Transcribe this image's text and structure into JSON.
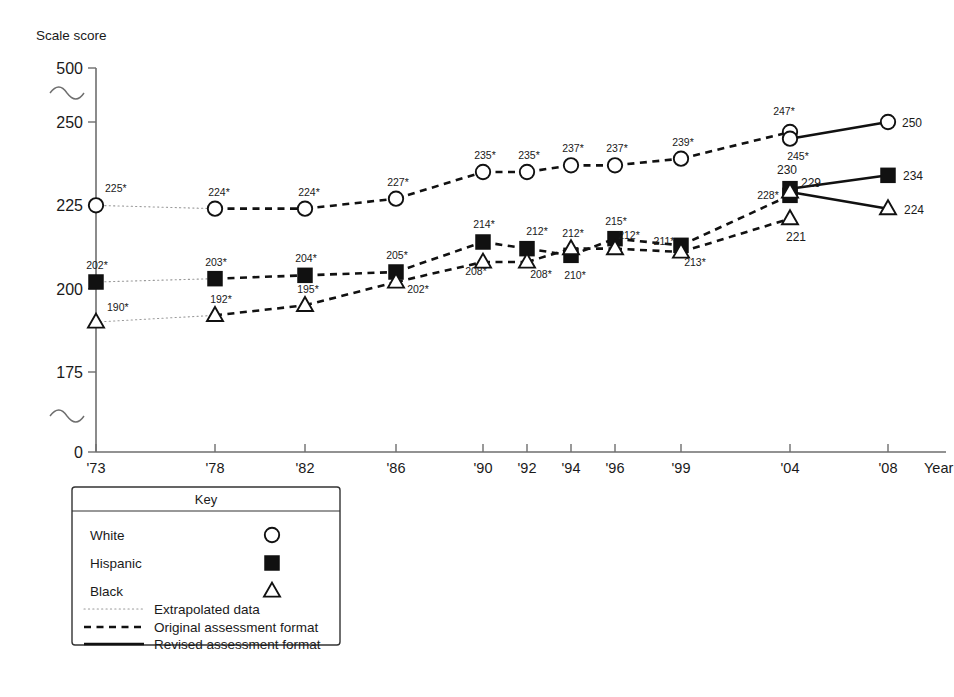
{
  "axes": {
    "y_title": "Scale score",
    "x_title": "Year",
    "y_ticks": [
      "500",
      "250",
      "225",
      "200",
      "175",
      "0"
    ],
    "x_ticks": [
      "'73",
      "'78",
      "'82",
      "'86",
      "'90",
      "'92",
      "'94",
      "'96",
      "'99",
      "'04",
      "'08"
    ]
  },
  "key": {
    "title": "Key",
    "series": [
      {
        "label": "White",
        "marker": "circle-open-icon"
      },
      {
        "label": "Hispanic",
        "marker": "square-filled-icon"
      },
      {
        "label": "Black",
        "marker": "triangle-open-icon"
      }
    ],
    "lines": [
      {
        "label": "Extrapolated data",
        "style": "dotted-line-icon"
      },
      {
        "label": "Original assessment format",
        "style": "dashed-line-icon"
      },
      {
        "label": "Revised assessment format",
        "style": "solid-line-icon"
      }
    ]
  },
  "chart_data": {
    "type": "line",
    "title": "",
    "xlabel": "Year",
    "ylabel": "Scale score",
    "x": [
      "'73",
      "'78",
      "'82",
      "'86",
      "'90",
      "'92",
      "'94",
      "'96",
      "'99",
      "'04",
      "'08"
    ],
    "ylim": [
      175,
      250
    ],
    "y_axis_breaks": [
      "between 0 and 175",
      "between 250 and 500"
    ],
    "y_ticks": [
      0,
      175,
      200,
      225,
      250,
      500
    ],
    "grid": false,
    "legend_position": "below-left",
    "note": "Asterisk (*) marks values significantly different from 2008. At '04 both original and revised assessment formats were administered, giving two points per series.",
    "series": [
      {
        "name": "White",
        "marker": "circle-open",
        "points": [
          {
            "x": "'73",
            "value": 225,
            "label": "225*",
            "significant": true,
            "segment": "extrapolated"
          },
          {
            "x": "'78",
            "value": 224,
            "label": "224*",
            "significant": true,
            "segment": "original"
          },
          {
            "x": "'82",
            "value": 224,
            "label": "224*",
            "significant": true,
            "segment": "original"
          },
          {
            "x": "'86",
            "value": 227,
            "label": "227*",
            "significant": true,
            "segment": "original"
          },
          {
            "x": "'90",
            "value": 235,
            "label": "235*",
            "significant": true,
            "segment": "original"
          },
          {
            "x": "'92",
            "value": 235,
            "label": "235*",
            "significant": true,
            "segment": "original"
          },
          {
            "x": "'94",
            "value": 237,
            "label": "237*",
            "significant": true,
            "segment": "original"
          },
          {
            "x": "'96",
            "value": 237,
            "label": "237*",
            "significant": true,
            "segment": "original"
          },
          {
            "x": "'99",
            "value": 239,
            "label": "239*",
            "significant": true,
            "segment": "original"
          },
          {
            "x": "'04",
            "value": 247,
            "label": "247*",
            "significant": true,
            "segment": "original"
          },
          {
            "x": "'04",
            "value": 245,
            "label": "245*",
            "significant": true,
            "segment": "revised"
          },
          {
            "x": "'08",
            "value": 250,
            "label": "250",
            "significant": false,
            "segment": "revised"
          }
        ]
      },
      {
        "name": "Hispanic",
        "marker": "square-filled",
        "points": [
          {
            "x": "'73",
            "value": 202,
            "label": "202*",
            "significant": true,
            "segment": "extrapolated"
          },
          {
            "x": "'78",
            "value": 203,
            "label": "203*",
            "significant": true,
            "segment": "original"
          },
          {
            "x": "'82",
            "value": 204,
            "label": "204*",
            "significant": true,
            "segment": "original"
          },
          {
            "x": "'86",
            "value": 205,
            "label": "205*",
            "significant": true,
            "segment": "original"
          },
          {
            "x": "'90",
            "value": 214,
            "label": "214*",
            "significant": true,
            "segment": "original"
          },
          {
            "x": "'92",
            "value": 212,
            "label": "212*",
            "significant": true,
            "segment": "original"
          },
          {
            "x": "'94",
            "value": 210,
            "label": "210*",
            "significant": true,
            "segment": "original"
          },
          {
            "x": "'96",
            "value": 215,
            "label": "215*",
            "significant": true,
            "segment": "original"
          },
          {
            "x": "'99",
            "value": 213,
            "label": "213*",
            "significant": true,
            "segment": "original"
          },
          {
            "x": "'04",
            "value": 228,
            "label": "228*",
            "significant": true,
            "segment": "original"
          },
          {
            "x": "'04",
            "value": 230,
            "label": "230",
            "significant": false,
            "segment": "revised"
          },
          {
            "x": "'08",
            "value": 234,
            "label": "234",
            "significant": false,
            "segment": "revised"
          }
        ]
      },
      {
        "name": "Black",
        "marker": "triangle-open",
        "points": [
          {
            "x": "'73",
            "value": 190,
            "label": "190*",
            "significant": true,
            "segment": "extrapolated"
          },
          {
            "x": "'78",
            "value": 192,
            "label": "192*",
            "significant": true,
            "segment": "original"
          },
          {
            "x": "'82",
            "value": 195,
            "label": "195*",
            "significant": true,
            "segment": "original"
          },
          {
            "x": "'86",
            "value": 202,
            "label": "202*",
            "significant": true,
            "segment": "original"
          },
          {
            "x": "'90",
            "value": 208,
            "label": "208*",
            "significant": true,
            "segment": "original"
          },
          {
            "x": "'92",
            "value": 208,
            "label": "208*",
            "significant": true,
            "segment": "original"
          },
          {
            "x": "'94",
            "value": 212,
            "label": "212*",
            "significant": true,
            "segment": "original"
          },
          {
            "x": "'96",
            "value": 212,
            "label": "212*",
            "significant": true,
            "segment": "original"
          },
          {
            "x": "'99",
            "value": 211,
            "label": "211*",
            "significant": true,
            "segment": "original"
          },
          {
            "x": "'04",
            "value": 221,
            "label": "221",
            "significant": false,
            "segment": "original"
          },
          {
            "x": "'04",
            "value": 229,
            "label": "229",
            "significant": false,
            "segment": "revised"
          },
          {
            "x": "'08",
            "value": 224,
            "label": "224",
            "significant": false,
            "segment": "revised"
          }
        ]
      }
    ]
  }
}
